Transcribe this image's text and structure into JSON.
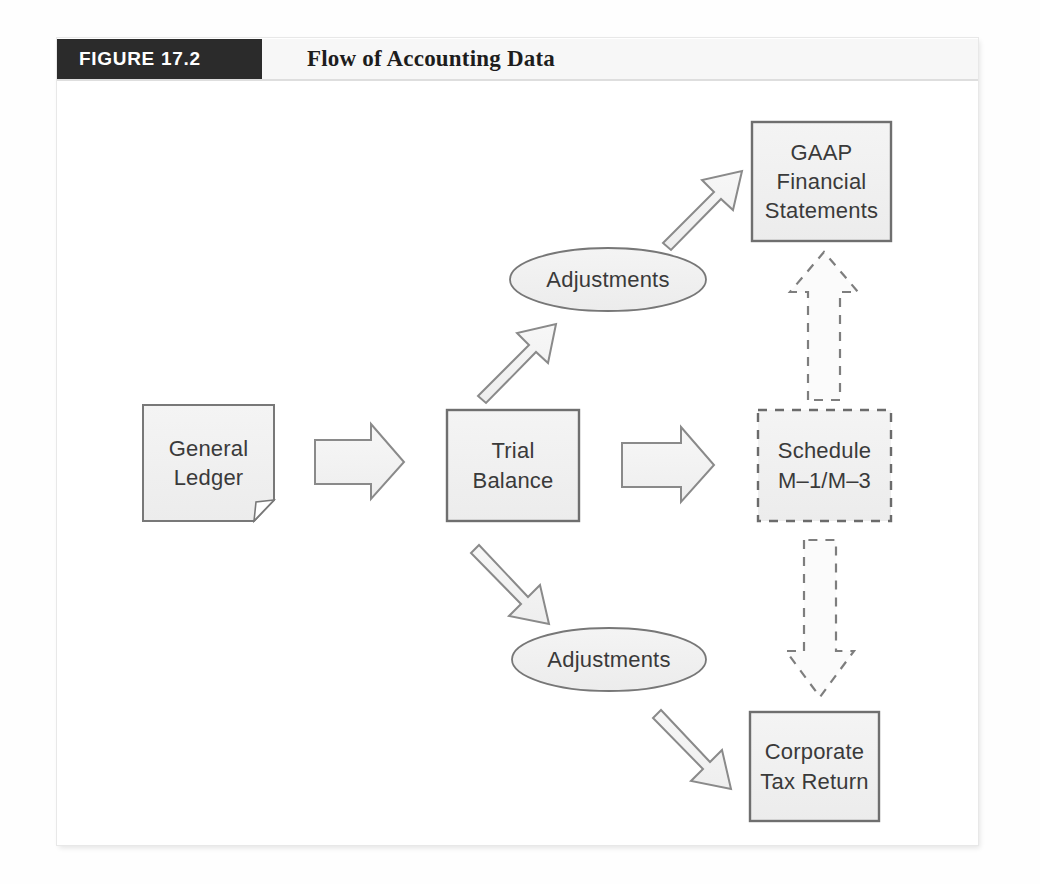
{
  "figure": {
    "tab_label": "FIGURE 17.2",
    "title": "Flow of Accounting Data"
  },
  "diagram": {
    "type": "flowchart",
    "nodes": [
      {
        "id": "general-ledger",
        "shape": "document",
        "style": "solid",
        "lines": [
          "General",
          "Ledger"
        ],
        "line1": "General",
        "line2": "Ledger"
      },
      {
        "id": "trial-balance",
        "shape": "rectangle",
        "style": "solid",
        "lines": [
          "Trial",
          "Balance"
        ],
        "line1": "Trial",
        "line2": "Balance"
      },
      {
        "id": "adjustments-top",
        "shape": "ellipse",
        "style": "solid",
        "lines": [
          "Adjustments"
        ],
        "line1": "Adjustments"
      },
      {
        "id": "adjustments-bottom",
        "shape": "ellipse",
        "style": "solid",
        "lines": [
          "Adjustments"
        ],
        "line1": "Adjustments"
      },
      {
        "id": "gaap-financial-statements",
        "shape": "rectangle",
        "style": "solid",
        "lines": [
          "GAAP",
          "Financial",
          "Statements"
        ],
        "line1": "GAAP",
        "line2": "Financial",
        "line3": "Statements"
      },
      {
        "id": "schedule-m1-m3",
        "shape": "rectangle",
        "style": "dashed",
        "lines": [
          "Schedule",
          "M–1/M–3"
        ],
        "line1": "Schedule",
        "line2": "M–1/M–3"
      },
      {
        "id": "corporate-tax-return",
        "shape": "rectangle",
        "style": "solid",
        "lines": [
          "Corporate",
          "Tax Return"
        ],
        "line1": "Corporate",
        "line2": "Tax Return"
      }
    ],
    "edges": [
      {
        "id": "gl-to-tb",
        "from": "general-ledger",
        "to": "trial-balance",
        "style": "solid",
        "direction": "right"
      },
      {
        "id": "tb-to-adj-top",
        "from": "trial-balance",
        "to": "adjustments-top",
        "style": "solid",
        "direction": "up-right"
      },
      {
        "id": "adjtop-to-gaap",
        "from": "adjustments-top",
        "to": "gaap-financial-statements",
        "style": "solid",
        "direction": "up-right"
      },
      {
        "id": "tb-to-schedule",
        "from": "trial-balance",
        "to": "schedule-m1-m3",
        "style": "solid",
        "direction": "right"
      },
      {
        "id": "tb-to-adj-bottom",
        "from": "trial-balance",
        "to": "adjustments-bottom",
        "style": "solid",
        "direction": "down-right"
      },
      {
        "id": "adjbot-to-tax",
        "from": "adjustments-bottom",
        "to": "corporate-tax-return",
        "style": "solid",
        "direction": "down-right"
      },
      {
        "id": "schedule-to-gaap",
        "from": "schedule-m1-m3",
        "to": "gaap-financial-statements",
        "style": "dashed",
        "direction": "up"
      },
      {
        "id": "schedule-to-tax",
        "from": "schedule-m1-m3",
        "to": "corporate-tax-return",
        "style": "dashed",
        "direction": "down"
      }
    ]
  },
  "colors": {
    "tab_background": "#2b2b2b",
    "tab_text": "#ffffff",
    "title_text": "#1d1d1d",
    "node_fill": "#f0f0f0",
    "node_stroke": "#7a7a7a",
    "node_text": "#3a3a3a",
    "arrow_fill": "#f2f2f2",
    "arrow_stroke": "#8a8a8a",
    "page_background": "#ffffff"
  }
}
